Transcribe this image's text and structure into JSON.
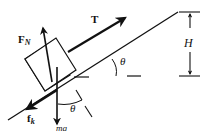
{
  "diagram": {
    "colors": {
      "ink": "#111111",
      "background": "#ffffff"
    },
    "labels": {
      "tension": "T",
      "normal_force_main": "F",
      "normal_force_sub": "N",
      "friction_main": "f",
      "friction_sub": "k",
      "weight": "mg",
      "angle_incline": "θ",
      "angle_weight": "θ",
      "height": "H"
    },
    "forces": [
      {
        "name": "tension",
        "label": "T",
        "direction": "up the incline"
      },
      {
        "name": "normal",
        "label": "F_N",
        "direction": "perpendicular to incline"
      },
      {
        "name": "kinetic-friction",
        "label": "f_k",
        "direction": "down the incline"
      },
      {
        "name": "weight",
        "label": "mg",
        "direction": "vertically down"
      }
    ]
  }
}
